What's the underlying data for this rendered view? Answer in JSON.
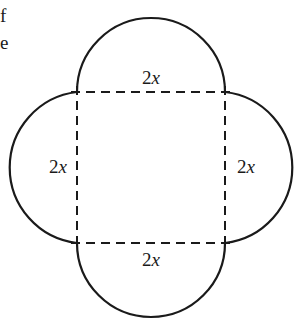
{
  "text_fragments": [
    "f",
    "e"
  ],
  "figure": {
    "labels": {
      "top": "2x",
      "left": "2x",
      "right": "2x",
      "bottom": "2x"
    },
    "colors": {
      "stroke": "#1a1a1a",
      "background": "#ffffff"
    }
  }
}
